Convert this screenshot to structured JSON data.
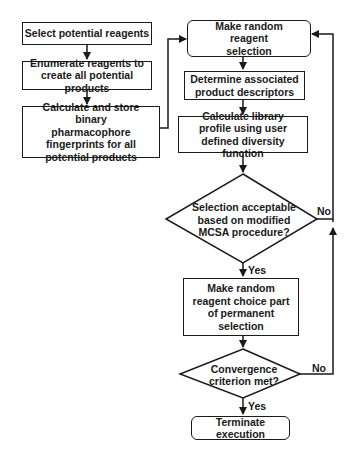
{
  "diagram": {
    "type": "flowchart",
    "left_column": [
      {
        "id": "select",
        "text": "Select potential reagents"
      },
      {
        "id": "enumerate",
        "text": "Enumerate reagents to create all potential products"
      },
      {
        "id": "fingerprints",
        "text": "Calculate and store binary pharmacophore fingerprints for all potential products"
      }
    ],
    "right_column": [
      {
        "id": "random_selection",
        "text": "Make random reagent selection"
      },
      {
        "id": "descriptors",
        "text": "Determine associated product descriptors"
      },
      {
        "id": "library_profile",
        "text": "Calculate library profile using user defined diversity function"
      },
      {
        "id": "mcsa_decision",
        "text": "Selection acceptable based on modified MCSA procedure?"
      },
      {
        "id": "permanent",
        "text": "Make random reagent choice part of permanent selection"
      },
      {
        "id": "convergence",
        "text": "Convergence criterion met?"
      },
      {
        "id": "terminate",
        "text": "Terminate execution"
      }
    ],
    "edge_labels": {
      "mcsa_yes": "Yes",
      "mcsa_no": "No",
      "conv_yes": "Yes",
      "conv_no": "No"
    }
  }
}
